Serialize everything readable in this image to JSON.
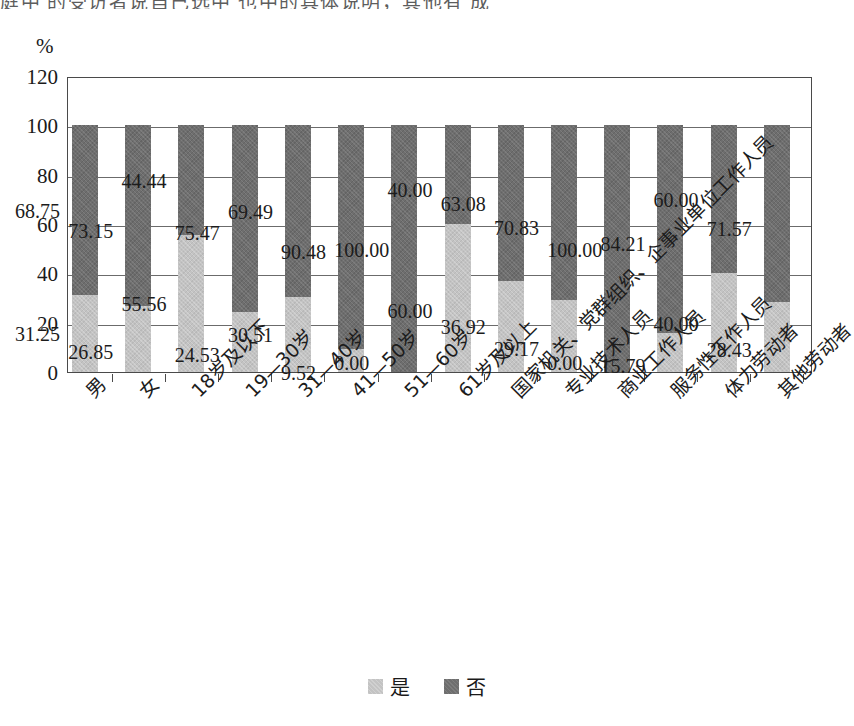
{
  "page": {
    "top_cut_text": "庭中 的受访者说自己选中 也中的具体说明，其他有  成"
  },
  "chart_data": {
    "type": "bar",
    "subtype": "stacked-100",
    "title": "",
    "xlabel": "",
    "ylabel": "%",
    "ylim": [
      0,
      120
    ],
    "yticks": [
      0,
      20,
      40,
      60,
      80,
      100,
      120
    ],
    "ytick_labels": [
      "0",
      "20",
      "40",
      "60",
      "80",
      "100",
      "120"
    ],
    "grid": true,
    "legend_position": "bottom",
    "categories": [
      "男",
      "女",
      "18岁及以下",
      "19—30岁",
      "31—40岁",
      "41—50岁",
      "51—60岁",
      "61岁及以上",
      "国家机关、党群组织、企事业单位工作人员",
      "专业技术人员",
      "商业工作人员",
      "服务性工作人员",
      "体力劳动者",
      "其他劳动者"
    ],
    "series": [
      {
        "name": "是",
        "color": "#c3c3c3",
        "values": [
          31.25,
          26.85,
          55.56,
          24.53,
          30.51,
          9.52,
          0.0,
          60.0,
          36.92,
          29.17,
          0.0,
          15.79,
          40.0,
          28.43
        ],
        "labels": [
          "31.25",
          "26.85",
          "55.56",
          "24.53",
          "30.51",
          "9.52",
          "0.00",
          "60.00",
          "36.92",
          "29.17",
          "0.00",
          "15.79",
          "40.00",
          "28.43"
        ]
      },
      {
        "name": "否",
        "color": "#6e6e6e",
        "values": [
          68.75,
          73.15,
          44.44,
          75.47,
          69.49,
          90.48,
          100.0,
          40.0,
          63.08,
          70.83,
          100.0,
          84.21,
          60.0,
          71.57
        ],
        "labels": [
          "68.75",
          "73.15",
          "44.44",
          "75.47",
          "69.49",
          "90.48",
          "100.00",
          "40.00",
          "63.08",
          "70.83",
          "100.00",
          "84.21",
          "60.00",
          "71.57"
        ]
      }
    ]
  },
  "legend": {
    "items": [
      {
        "label": "是",
        "swatch": "light-gray-swatch"
      },
      {
        "label": "否",
        "swatch": "dark-gray-swatch"
      }
    ]
  }
}
